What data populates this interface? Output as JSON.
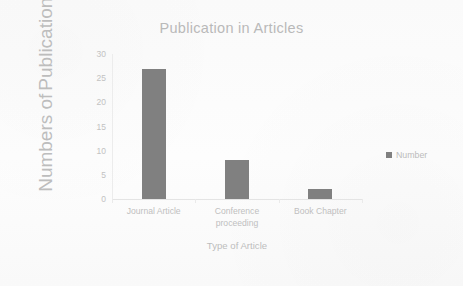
{
  "chart_data": {
    "type": "bar",
    "title": "Publication in Articles",
    "categories": [
      "Journal Article",
      "Conference proceeding",
      "Book Chapter"
    ],
    "values": [
      27,
      8,
      2
    ],
    "series": [
      {
        "name": "Number",
        "values": [
          27,
          8,
          2
        ]
      }
    ],
    "xlabel": "Type of Article",
    "ylabel": "Numbers of Publications",
    "ylabel_line1": "Numbers of",
    "ylabel_line2": "Publications",
    "ylim": [
      0,
      30
    ],
    "yticks": [
      0,
      5,
      10,
      15,
      20,
      25,
      30
    ],
    "ytick_labels": [
      "0",
      "5",
      "10",
      "15",
      "20",
      "25",
      "30"
    ],
    "grid": false,
    "legend": {
      "position": "right",
      "entries": [
        {
          "label": "Number",
          "color": "#808080"
        }
      ]
    },
    "bar_color": "#808080",
    "axis_color": "#e8e8e8",
    "text_color": "#bdbdbd",
    "background": "#fdfdfd"
  }
}
